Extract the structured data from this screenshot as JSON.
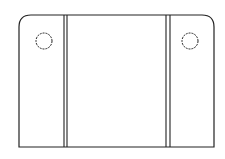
{
  "diagram": {
    "type": "technical-line-drawing",
    "colors": {
      "stroke": "#222222",
      "background": "#ffffff"
    },
    "outline": {
      "left": 19,
      "top": 15,
      "right": 214,
      "bottom": 147,
      "corner_radius": 12
    },
    "dividers": [
      {
        "x1": 64,
        "x2": 67
      },
      {
        "x1": 166,
        "x2": 170
      }
    ],
    "holes": [
      {
        "cx": 44,
        "cy": 41,
        "r": 8
      },
      {
        "cx": 190,
        "cy": 41,
        "r": 8
      }
    ]
  }
}
